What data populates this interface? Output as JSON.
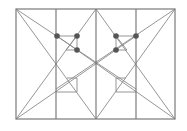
{
  "diagram": {
    "width": 187,
    "height": 131,
    "colors": {
      "line": "#8a8a8a",
      "frame": "#7a7a7a",
      "vertical": "#707070",
      "dot": "#555555",
      "background": "#ffffff"
    },
    "frame": {
      "x1": 16,
      "y1": 9,
      "x2": 175,
      "y2": 119
    },
    "verticals": [
      56,
      96,
      136
    ],
    "lines": [
      {
        "x1": 16,
        "y1": 9,
        "x2": 96,
        "y2": 119
      },
      {
        "x1": 175,
        "y1": 9,
        "x2": 96,
        "y2": 119
      },
      {
        "x1": 16,
        "y1": 119,
        "x2": 96,
        "y2": 9
      },
      {
        "x1": 175,
        "y1": 119,
        "x2": 96,
        "y2": 9
      },
      {
        "x1": 16,
        "y1": 9,
        "x2": 136,
        "y2": 89
      },
      {
        "x1": 175,
        "y1": 9,
        "x2": 56,
        "y2": 89
      },
      {
        "x1": 16,
        "y1": 119,
        "x2": 136,
        "y2": 36
      },
      {
        "x1": 175,
        "y1": 119,
        "x2": 57,
        "y2": 36
      },
      {
        "x1": 57,
        "y1": 36,
        "x2": 77,
        "y2": 36
      },
      {
        "x1": 77,
        "y1": 36,
        "x2": 77,
        "y2": 50
      },
      {
        "x1": 77,
        "y1": 36,
        "x2": 66,
        "y2": 50
      },
      {
        "x1": 66,
        "y1": 50,
        "x2": 77,
        "y2": 50
      },
      {
        "x1": 116,
        "y1": 36,
        "x2": 136,
        "y2": 36
      },
      {
        "x1": 116,
        "y1": 36,
        "x2": 116,
        "y2": 50
      },
      {
        "x1": 116,
        "y1": 36,
        "x2": 127,
        "y2": 50
      },
      {
        "x1": 116,
        "y1": 50,
        "x2": 127,
        "y2": 50
      },
      {
        "x1": 67,
        "y1": 78,
        "x2": 77,
        "y2": 78
      },
      {
        "x1": 77,
        "y1": 78,
        "x2": 77,
        "y2": 92
      },
      {
        "x1": 56,
        "y1": 92,
        "x2": 77,
        "y2": 92
      },
      {
        "x1": 116,
        "y1": 78,
        "x2": 126,
        "y2": 78
      },
      {
        "x1": 116,
        "y1": 78,
        "x2": 116,
        "y2": 92
      },
      {
        "x1": 116,
        "y1": 92,
        "x2": 136,
        "y2": 92
      }
    ],
    "dots": [
      {
        "cx": 57,
        "cy": 36
      },
      {
        "cx": 77,
        "cy": 36
      },
      {
        "cx": 77,
        "cy": 50
      },
      {
        "cx": 116,
        "cy": 36
      },
      {
        "cx": 136,
        "cy": 36
      },
      {
        "cx": 116,
        "cy": 50
      }
    ],
    "dot_radius": 2.8
  }
}
